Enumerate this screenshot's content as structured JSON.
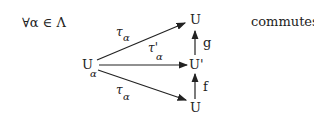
{
  "quantifier": "∀α ∈ Λ",
  "conclusion": "commutes.",
  "nodes": {
    "source": {
      "label": "U",
      "subscript": "α"
    },
    "top": {
      "label": "U"
    },
    "middle": {
      "label": "U'"
    },
    "bottom": {
      "label": "U"
    }
  },
  "arrows": {
    "top": {
      "label": "τ",
      "subscript": "α"
    },
    "middle": {
      "label": "τ'",
      "subscript": "α"
    },
    "bottom": {
      "label": "τ",
      "subscript": "α"
    },
    "g": {
      "label": "g"
    },
    "f": {
      "label": "f"
    }
  },
  "colors": {
    "ink": "#222222",
    "background": "#ffffff"
  }
}
